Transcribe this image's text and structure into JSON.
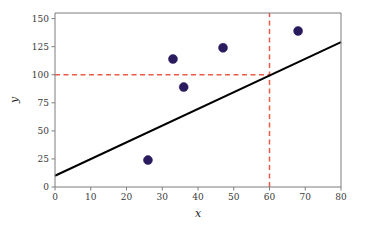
{
  "chart_data": {
    "type": "scatter",
    "title": "",
    "xlabel": "x",
    "ylabel": "y",
    "xlim": [
      0,
      80
    ],
    "ylim": [
      0,
      155
    ],
    "xticks": [
      0,
      10,
      20,
      30,
      40,
      50,
      60,
      70,
      80
    ],
    "yticks": [
      0,
      25,
      50,
      75,
      100,
      125,
      150
    ],
    "xtick_labels": [
      "0",
      "10",
      "20",
      "30",
      "40",
      "50",
      "60",
      "70",
      "80"
    ],
    "ytick_labels": [
      "0",
      "25",
      "50",
      "75",
      "100",
      "125",
      "150"
    ],
    "grid": false,
    "legend": null,
    "series": [
      {
        "name": "data points",
        "type": "scatter",
        "marker": "circle",
        "color": "#2a1a5e",
        "marker_size": 9,
        "points": [
          {
            "x": 26,
            "y": 24
          },
          {
            "x": 33,
            "y": 114
          },
          {
            "x": 36,
            "y": 89
          },
          {
            "x": 47,
            "y": 124
          },
          {
            "x": 68,
            "y": 139
          }
        ]
      },
      {
        "name": "fit line",
        "type": "line",
        "color": "#000000",
        "linewidth": 2,
        "linestyle": "solid",
        "points": [
          {
            "x": 0,
            "y": 10
          },
          {
            "x": 80,
            "y": 129
          }
        ]
      },
      {
        "name": "horizontal reference line",
        "type": "line",
        "color": "#ef5a47",
        "linewidth": 1.5,
        "linestyle": "dashed",
        "points": [
          {
            "x": 0,
            "y": 100
          },
          {
            "x": 60,
            "y": 100
          }
        ]
      },
      {
        "name": "vertical reference line",
        "type": "line",
        "color": "#ef5a47",
        "linewidth": 1.5,
        "linestyle": "dashed",
        "points": [
          {
            "x": 60,
            "y": 0
          },
          {
            "x": 60,
            "y": 155
          }
        ]
      }
    ],
    "annotations": [
      {
        "label": "reference x value",
        "value": 60
      },
      {
        "label": "reference y value",
        "value": 100
      }
    ]
  },
  "axes": {
    "x_title": "x",
    "y_title": "y"
  },
  "colors": {
    "marker": "#2a1a5e",
    "line": "#000000",
    "reference": "#ef5a47",
    "spine": "#7d7d7d",
    "tick_text": "#3a3a3a",
    "background": "#ffffff"
  }
}
